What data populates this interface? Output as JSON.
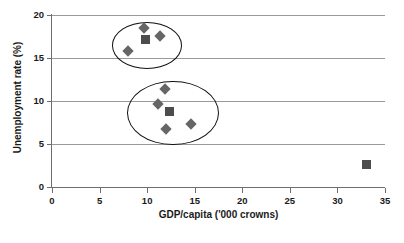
{
  "chart_data": {
    "type": "scatter",
    "title": "",
    "xlabel": "GDP/capita ('000 crowns)",
    "ylabel": "Unemployment rate (%)",
    "xlim": [
      0,
      35
    ],
    "ylim": [
      0,
      20
    ],
    "xticks": [
      0,
      5,
      10,
      15,
      20,
      25,
      30,
      35
    ],
    "yticks": [
      0,
      5,
      10,
      15,
      20
    ],
    "xtick_labels": [
      "0",
      "5",
      "10",
      "15",
      "20",
      "25",
      "30",
      "35"
    ],
    "ytick_labels": [
      "0",
      "5",
      "10",
      "15",
      "20"
    ],
    "grid": "horizontal",
    "legend": "none",
    "series": [
      {
        "name": "diamond-points",
        "marker": "diamond",
        "color": "#666666",
        "points": [
          {
            "x": 8.0,
            "y": 15.8
          },
          {
            "x": 9.7,
            "y": 18.5
          },
          {
            "x": 11.4,
            "y": 17.6
          },
          {
            "x": 11.9,
            "y": 11.4
          },
          {
            "x": 11.1,
            "y": 9.7
          },
          {
            "x": 12.0,
            "y": 6.7
          },
          {
            "x": 14.6,
            "y": 7.3
          }
        ]
      },
      {
        "name": "square-points",
        "marker": "square",
        "color": "#4d4d4d",
        "points": [
          {
            "x": 9.8,
            "y": 17.2
          },
          {
            "x": 12.4,
            "y": 8.8
          },
          {
            "x": 33.1,
            "y": 2.6
          }
        ]
      }
    ],
    "annotations": [
      {
        "name": "upper-cluster-ellipse",
        "shape": "ellipse",
        "cx": 9.9,
        "cy": 16.6,
        "rx": 3.6,
        "ry": 2.6,
        "stroke": "#111111"
      },
      {
        "name": "lower-cluster-ellipse",
        "shape": "ellipse",
        "cx": 12.6,
        "cy": 8.7,
        "rx": 4.7,
        "ry": 3.6,
        "stroke": "#111111"
      }
    ]
  },
  "colors": {
    "background": "#ffffff",
    "gridline": "#9a9a9a",
    "axis": "#6e6e6e",
    "text": "#1a1a1a",
    "diamond_marker": "#666666",
    "square_marker": "#4d4d4d",
    "ellipse_stroke": "#111111"
  }
}
